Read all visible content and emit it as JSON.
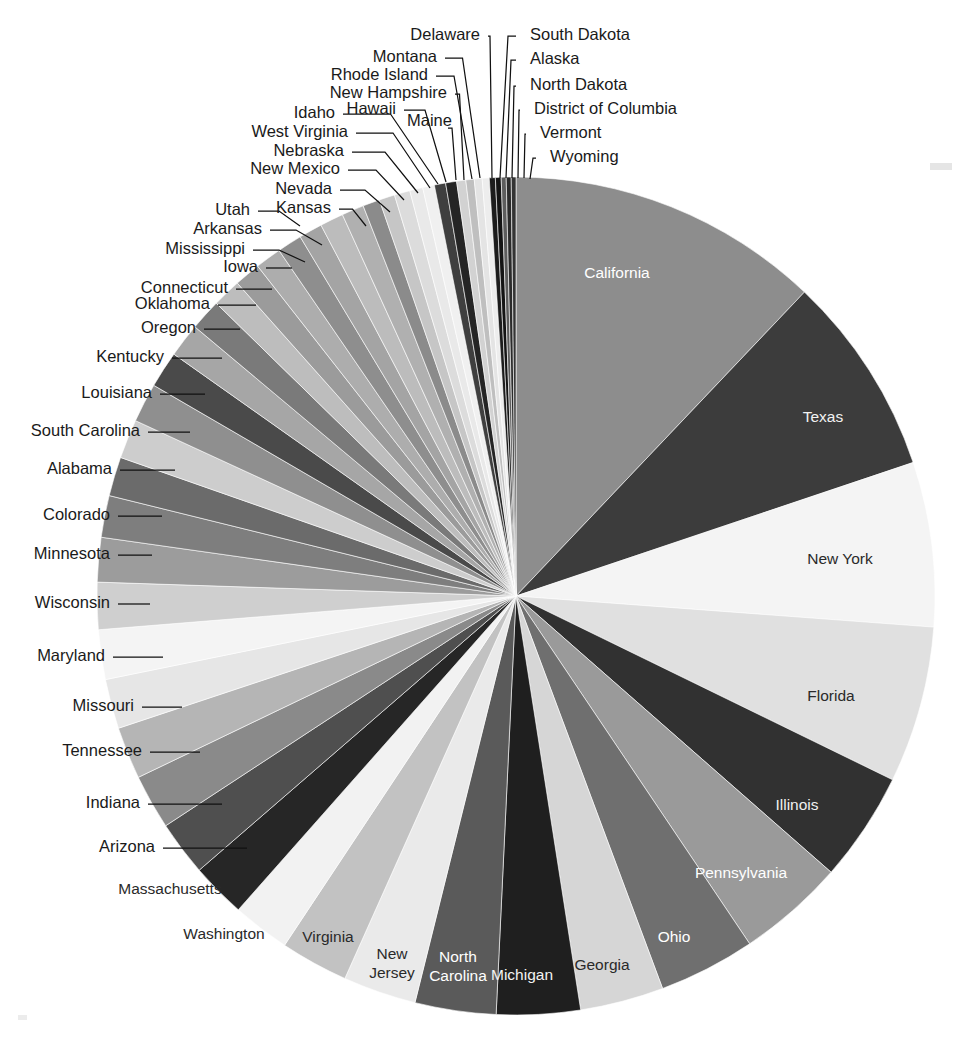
{
  "chart_data": {
    "type": "pie",
    "title": "",
    "subtitle": "",
    "xlabel": "",
    "ylabel": "",
    "legend_position": "none",
    "grid": false,
    "label_mode": "inside-for-large-slices, leader-lines-for-small-slices",
    "start_angle_deg": -90,
    "direction": "clockwise",
    "center": {
      "x": 516,
      "y": 596
    },
    "radius": 419,
    "categories": [
      "California",
      "Texas",
      "New York",
      "Florida",
      "Illinois",
      "Pennsylvania",
      "Ohio",
      "Georgia",
      "Michigan",
      "North Carolina",
      "New Jersey",
      "Virginia",
      "Washington",
      "Massachusetts",
      "Arizona",
      "Indiana",
      "Tennessee",
      "Missouri",
      "Maryland",
      "Wisconsin",
      "Minnesota",
      "Colorado",
      "Alabama",
      "South Carolina",
      "Louisiana",
      "Kentucky",
      "Oregon",
      "Oklahoma",
      "Connecticut",
      "Iowa",
      "Mississippi",
      "Arkansas",
      "Utah",
      "Kansas",
      "Nevada",
      "New Mexico",
      "Nebraska",
      "West Virginia",
      "Idaho",
      "Hawaii",
      "Maine",
      "New Hampshire",
      "Rhode Island",
      "Montana",
      "Delaware",
      "South Dakota",
      "Alaska",
      "North Dakota",
      "District of Columbia",
      "Vermont",
      "Wyoming"
    ],
    "values": [
      12.0,
      7.7,
      6.3,
      6.0,
      4.2,
      4.1,
      3.7,
      3.2,
      3.2,
      3.1,
      2.8,
      2.6,
      2.2,
      2.1,
      2.1,
      2.1,
      2.0,
      1.9,
      1.9,
      1.8,
      1.7,
      1.6,
      1.5,
      1.5,
      1.5,
      1.4,
      1.3,
      1.2,
      1.1,
      1.0,
      1.0,
      0.95,
      0.9,
      0.9,
      0.85,
      0.65,
      0.6,
      0.6,
      0.5,
      0.45,
      0.43,
      0.42,
      0.35,
      0.32,
      0.3,
      0.27,
      0.23,
      0.22,
      0.19,
      0.19,
      0.18
    ],
    "value_unit": "percent of total",
    "colors": [
      "#8d8d8d",
      "#3c3c3c",
      "#f4f4f4",
      "#e0e0e0",
      "#313131",
      "#9a9a9a",
      "#6f6f6f",
      "#d6d6d6",
      "#1f1f1f",
      "#5a5a5a",
      "#eaeaea",
      "#c2c2c2",
      "#f2f2f2",
      "#262626",
      "#4f4f4f",
      "#8a8a8a",
      "#b5b5b5",
      "#e6e6e6",
      "#f4f4f4",
      "#cfcfcf",
      "#9c9c9c",
      "#7e7e7e",
      "#6b6b6b",
      "#cdcdcd",
      "#8f8f8f",
      "#4a4a4a",
      "#a6a6a6",
      "#7a7a7a",
      "#bdbdbd",
      "#9b9b9b",
      "#adadad",
      "#8e8e8e",
      "#a4a4a4",
      "#bcbcbc",
      "#b0b0b0",
      "#8b8b8b",
      "#c6c6c6",
      "#dcdcdc",
      "#e9e9e9",
      "#f0f0f0",
      "#3f3f3f",
      "#252525",
      "#d2d2d2",
      "#bfbfbf",
      "#e4e4e4",
      "#ededed",
      "#1c1c1c",
      "#141414",
      "#5d5d5d",
      "#2b2b2b",
      "#343434"
    ],
    "inner_labels": [
      {
        "name": "California",
        "text": "California",
        "x": 617,
        "y": 274,
        "fill": "#ffffff"
      },
      {
        "name": "Texas",
        "text": "Texas",
        "x": 823,
        "y": 418,
        "fill": "#f2f2f2"
      },
      {
        "name": "New York",
        "text": "New York",
        "x": 840,
        "y": 560,
        "fill": "#2a2a2a"
      },
      {
        "name": "Florida",
        "text": "Florida",
        "x": 831,
        "y": 697,
        "fill": "#2a2a2a"
      },
      {
        "name": "Illinois",
        "text": "Illinois",
        "x": 797,
        "y": 806,
        "fill": "#f0f0f0"
      },
      {
        "name": "Pennsylvania",
        "text": "Pennsylvania",
        "x": 741,
        "y": 874,
        "fill": "#ffffff"
      },
      {
        "name": "Ohio",
        "text": "Ohio",
        "x": 674,
        "y": 938,
        "fill": "#ffffff"
      },
      {
        "name": "Georgia",
        "text": "Georgia",
        "x": 602,
        "y": 966,
        "fill": "#2a2a2a"
      },
      {
        "name": "Michigan",
        "text": "Michigan",
        "x": 522,
        "y": 976,
        "fill": "#f2f2f2"
      },
      {
        "name": "North Carolina",
        "text": "North",
        "x": 458,
        "y": 958,
        "fill": "#ffffff"
      },
      {
        "name": "North Carolina",
        "text": "Carolina",
        "x": 458,
        "y": 977,
        "fill": "#ffffff"
      },
      {
        "name": "New Jersey",
        "text": "New",
        "x": 392,
        "y": 955,
        "fill": "#2a2a2a"
      },
      {
        "name": "New Jersey",
        "text": "Jersey",
        "x": 392,
        "y": 974,
        "fill": "#2a2a2a"
      },
      {
        "name": "Virginia",
        "text": "Virginia",
        "x": 328,
        "y": 938,
        "fill": "#2a2a2a"
      },
      {
        "name": "Washington",
        "text": "Washington",
        "x": 224,
        "y": 935,
        "fill": "#2a2a2a"
      },
      {
        "name": "Massachusetts",
        "text": "Massachusetts",
        "x": 170,
        "y": 890,
        "fill": "#2a2a2a"
      }
    ],
    "outer_labels": [
      {
        "name": "Arizona",
        "text": "Arizona",
        "x": 155,
        "y": 848,
        "anchor": "end",
        "lx": 163,
        "ly": 848,
        "px": 247,
        "py": 848
      },
      {
        "name": "Indiana",
        "text": "Indiana",
        "x": 140,
        "y": 804,
        "anchor": "end",
        "lx": 148,
        "ly": 804,
        "px": 222,
        "py": 804
      },
      {
        "name": "Tennessee",
        "text": "Tennessee",
        "x": 142,
        "y": 752,
        "anchor": "end",
        "lx": 150,
        "ly": 752,
        "px": 200,
        "py": 752
      },
      {
        "name": "Missouri",
        "text": "Missouri",
        "x": 134,
        "y": 707,
        "anchor": "end",
        "lx": 142,
        "ly": 707,
        "px": 182,
        "py": 707
      },
      {
        "name": "Maryland",
        "text": "Maryland",
        "x": 105,
        "y": 657,
        "anchor": "end",
        "lx": 113,
        "ly": 657,
        "px": 163,
        "py": 657
      },
      {
        "name": "Wisconsin",
        "text": "Wisconsin",
        "x": 110,
        "y": 604,
        "anchor": "end",
        "lx": 118,
        "ly": 604,
        "px": 150,
        "py": 604
      },
      {
        "name": "Minnesota",
        "text": "Minnesota",
        "x": 110,
        "y": 555,
        "anchor": "end",
        "lx": 118,
        "ly": 555,
        "px": 152,
        "py": 555
      },
      {
        "name": "Colorado",
        "text": "Colorado",
        "x": 110,
        "y": 516,
        "anchor": "end",
        "lx": 118,
        "ly": 516,
        "px": 162,
        "py": 516
      },
      {
        "name": "Alabama",
        "text": "Alabama",
        "x": 112,
        "y": 470,
        "anchor": "end",
        "lx": 120,
        "ly": 470,
        "px": 175,
        "py": 470
      },
      {
        "name": "South Carolina",
        "text": "South Carolina",
        "x": 140,
        "y": 432,
        "anchor": "end",
        "lx": 148,
        "ly": 432,
        "px": 190,
        "py": 432
      },
      {
        "name": "Louisiana",
        "text": "Louisiana",
        "x": 152,
        "y": 394,
        "anchor": "end",
        "lx": 160,
        "ly": 394,
        "px": 205,
        "py": 394
      },
      {
        "name": "Kentucky",
        "text": "Kentucky",
        "x": 164,
        "y": 358,
        "anchor": "end",
        "lx": 172,
        "ly": 358,
        "px": 222,
        "py": 358
      },
      {
        "name": "Oregon",
        "text": "Oregon",
        "x": 196,
        "y": 329,
        "anchor": "end",
        "lx": 204,
        "ly": 329,
        "px": 240,
        "py": 329
      },
      {
        "name": "Oklahoma",
        "text": "Oklahoma",
        "x": 210,
        "y": 305,
        "anchor": "end",
        "lx": 218,
        "ly": 305,
        "px": 256,
        "py": 305
      },
      {
        "name": "Connecticut",
        "text": "Connecticut",
        "x": 228,
        "y": 289,
        "anchor": "end",
        "lx": 236,
        "ly": 289,
        "px": 272,
        "py": 289
      },
      {
        "name": "Iowa",
        "text": "Iowa",
        "x": 258,
        "y": 268,
        "anchor": "end",
        "lx": 266,
        "ly": 268,
        "px": 292,
        "py": 268
      },
      {
        "name": "Mississippi",
        "text": "Mississippi",
        "x": 245,
        "y": 250,
        "anchor": "end",
        "lx": 253,
        "ly": 250,
        "px": 305,
        "py": 262
      },
      {
        "name": "Arkansas",
        "text": "Arkansas",
        "x": 262,
        "y": 230,
        "anchor": "end",
        "lx": 270,
        "ly": 230,
        "px": 322,
        "py": 245
      },
      {
        "name": "Utah",
        "text": "Utah",
        "x": 250,
        "y": 211,
        "anchor": "end",
        "lx": 258,
        "ly": 211,
        "px": 300,
        "py": 226
      },
      {
        "name": "Kansas",
        "text": "Kansas",
        "x": 331,
        "y": 209,
        "anchor": "end",
        "lx": 339,
        "ly": 209,
        "px": 366,
        "py": 226
      },
      {
        "name": "Nevada",
        "text": "Nevada",
        "x": 332,
        "y": 190,
        "anchor": "end",
        "lx": 340,
        "ly": 190,
        "px": 390,
        "py": 212
      },
      {
        "name": "New Mexico",
        "text": "New Mexico",
        "x": 340,
        "y": 170,
        "anchor": "end",
        "lx": 348,
        "ly": 170,
        "px": 404,
        "py": 200
      },
      {
        "name": "Nebraska",
        "text": "Nebraska",
        "x": 344,
        "y": 152,
        "anchor": "end",
        "lx": 352,
        "ly": 152,
        "px": 418,
        "py": 193
      },
      {
        "name": "West Virginia",
        "text": "West Virginia",
        "x": 348,
        "y": 133,
        "anchor": "end",
        "lx": 356,
        "ly": 133,
        "px": 430,
        "py": 188
      },
      {
        "name": "Idaho",
        "text": "Idaho",
        "x": 335,
        "y": 114,
        "anchor": "end",
        "lx": 343,
        "ly": 114,
        "px": 438,
        "py": 184
      },
      {
        "name": "Hawaii",
        "text": "Hawaii",
        "x": 396,
        "y": 110,
        "anchor": "end",
        "lx": 404,
        "ly": 110,
        "px": 446,
        "py": 182
      },
      {
        "name": "Maine",
        "text": "Maine",
        "x": 407,
        "y": 122,
        "anchor": "start",
        "lx": 448,
        "ly": 128,
        "px": 456,
        "py": 180
      },
      {
        "name": "New Hampshire",
        "text": "New Hampshire",
        "x": 447,
        "y": 94,
        "anchor": "end",
        "lx": 455,
        "ly": 94,
        "px": 464,
        "py": 180
      },
      {
        "name": "Rhode Island",
        "text": "Rhode Island",
        "x": 428,
        "y": 76,
        "anchor": "end",
        "lx": 436,
        "ly": 76,
        "px": 472,
        "py": 179
      },
      {
        "name": "Montana",
        "text": "Montana",
        "x": 437,
        "y": 58,
        "anchor": "end",
        "lx": 445,
        "ly": 58,
        "px": 480,
        "py": 178
      },
      {
        "name": "Delaware",
        "text": "Delaware",
        "x": 480,
        "y": 36,
        "anchor": "end",
        "lx": 488,
        "ly": 36,
        "px": 492,
        "py": 178
      },
      {
        "name": "South Dakota",
        "text": "South Dakota",
        "x": 530,
        "y": 36,
        "anchor": "start",
        "lx": 516,
        "ly": 36,
        "px": 500,
        "py": 178
      },
      {
        "name": "Alaska",
        "text": "Alaska",
        "x": 530,
        "y": 60,
        "anchor": "start",
        "lx": 516,
        "ly": 60,
        "px": 506,
        "py": 178
      },
      {
        "name": "North Dakota",
        "text": "North Dakota",
        "x": 530,
        "y": 86,
        "anchor": "start",
        "lx": 516,
        "ly": 86,
        "px": 512,
        "py": 178
      },
      {
        "name": "District of Columbia",
        "text": "District of Columbia",
        "x": 534,
        "y": 110,
        "anchor": "start",
        "lx": 520,
        "ly": 110,
        "px": 518,
        "py": 178
      },
      {
        "name": "Vermont",
        "text": "Vermont",
        "x": 540,
        "y": 134,
        "anchor": "start",
        "lx": 526,
        "ly": 134,
        "px": 524,
        "py": 178
      },
      {
        "name": "Wyoming",
        "text": "Wyoming",
        "x": 550,
        "y": 158,
        "anchor": "start",
        "lx": 536,
        "ly": 158,
        "px": 530,
        "py": 179
      }
    ]
  }
}
